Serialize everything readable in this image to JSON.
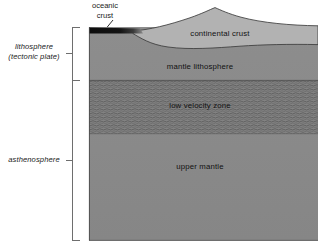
{
  "diagram": {
    "type": "geologic-cross-section"
  },
  "side_labels": {
    "lithosphere_line1": "lithosphere",
    "lithosphere_line2": "(tectonic plate)",
    "asthenosphere": "asthenosphere"
  },
  "callouts": {
    "oceanic_crust_line1": "oceanic",
    "oceanic_crust_line2": "crust"
  },
  "units": {
    "continental_crust": "continental crust",
    "mantle_lithosphere": "mantle lithosphere",
    "low_velocity_zone": "low velocity zone",
    "upper_mantle": "upper mantle"
  },
  "colors": {
    "background": "#ffffff",
    "mantle_gray": "#8a8a8a",
    "continental_crust_gray": "#b2b2b2",
    "oceanic_crust_dark": "#151515",
    "low_velocity_zone_gray": "#7e7e7e",
    "outline": "#3d3d3d",
    "bracket": "#6e6e6e",
    "text": "#111111"
  },
  "geometry": {
    "body_left": 89,
    "body_right": 318,
    "body_top": 27,
    "body_bottom": 240,
    "lithosphere_bracket_top": 27,
    "lithosphere_bracket_bottom": 80,
    "asthenosphere_bracket_top": 80,
    "asthenosphere_bracket_bottom": 240,
    "low_velocity_zone_top": 80,
    "low_velocity_zone_bottom": 134
  }
}
